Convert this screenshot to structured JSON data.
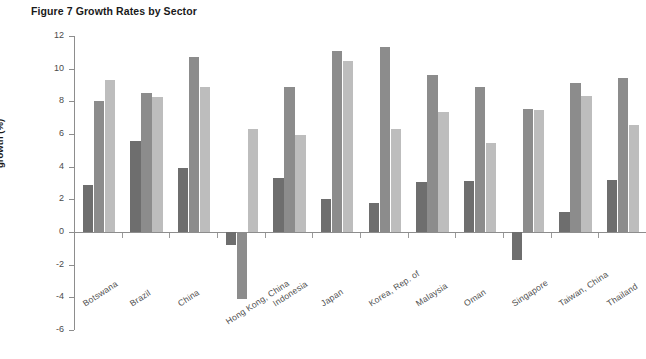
{
  "figure": {
    "title": "Figure 7 Growth Rates by Sector"
  },
  "chart_data": {
    "type": "bar",
    "title": "Figure 7 Growth Rates by Sector",
    "xlabel": "",
    "ylabel": "growth (%)",
    "ylim": [
      -6,
      12
    ],
    "yticks": [
      12,
      10,
      8,
      6,
      4,
      2,
      0,
      -2,
      -4,
      -6
    ],
    "ytick_labels": [
      "12",
      "10",
      "8",
      "6",
      "4",
      "2",
      "0",
      "-2",
      "-4",
      "-6"
    ],
    "grid": false,
    "legend": "none",
    "orientation": "vertical",
    "grouped": true,
    "categories": [
      "Botswana",
      "Brazil",
      "China",
      "Hong Kong, China",
      "Indonesia",
      "Japan",
      "Korea, Rep. of",
      "Malaysia",
      "Oman",
      "Singapore",
      "Taiwan, China",
      "Thailand"
    ],
    "series": [
      {
        "name": "series-1",
        "color": "#6e6e6e",
        "values": [
          2.9,
          5.6,
          3.9,
          -0.8,
          3.3,
          2.0,
          1.8,
          3.05,
          3.1,
          -1.7,
          1.2,
          3.2
        ]
      },
      {
        "name": "series-2",
        "color": "#8c8c8c",
        "values": [
          8.0,
          8.5,
          10.7,
          -4.1,
          8.9,
          11.1,
          11.3,
          9.6,
          8.9,
          7.55,
          9.15,
          9.45
        ]
      },
      {
        "name": "series-3",
        "color": "#bdbdbd",
        "values": [
          9.3,
          8.25,
          8.9,
          6.3,
          5.95,
          10.5,
          6.3,
          7.35,
          5.45,
          7.5,
          8.3,
          6.55
        ]
      }
    ]
  }
}
